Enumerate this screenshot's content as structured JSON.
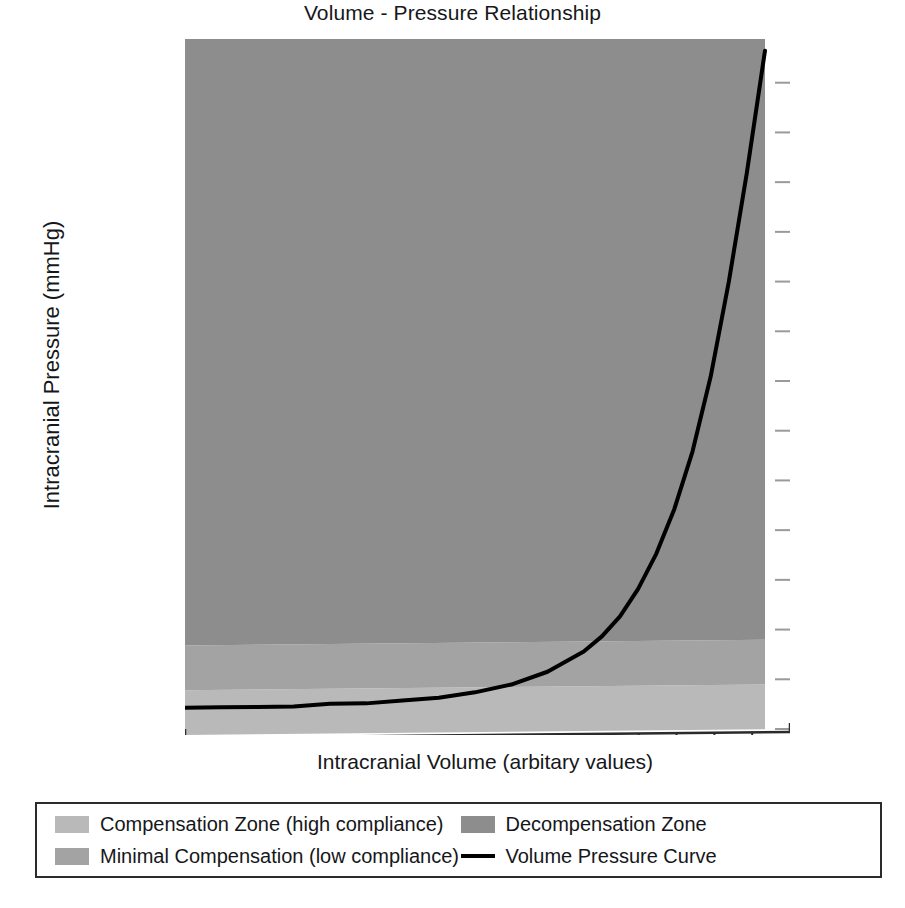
{
  "chart_data": {
    "type": "line",
    "title": "Volume - Pressure Relationship",
    "xlabel": "Intracranial Volume (arbitary values)",
    "ylabel": "Intracranial Pressure (mmHg)",
    "grid": false,
    "legend_position": "bottom",
    "xlim": [
      0,
      16
    ],
    "ylim": [
      0,
      280
    ],
    "yticks": [
      0,
      20,
      40,
      60,
      80,
      100,
      120,
      140,
      160,
      180,
      200,
      220,
      240,
      260,
      280
    ],
    "ytick_labels": [
      "0",
      "20",
      "40",
      "60",
      "80",
      "100",
      "120",
      "140",
      "160",
      "180",
      "200",
      "220",
      "240",
      "260",
      "280"
    ],
    "xticks": [
      0,
      1,
      2,
      3,
      4,
      5,
      6,
      7,
      8,
      9,
      10,
      11,
      12,
      13,
      14,
      15,
      16
    ],
    "xtick_labels": [
      "",
      "",
      "",
      "",
      "",
      "",
      "",
      "",
      "",
      "",
      "",
      "",
      "",
      "",
      "",
      "",
      ""
    ],
    "series": [
      {
        "name": "Volume Pressure Curve",
        "color": "#000000",
        "linewidth": 4,
        "x": [
          0.0,
          1.0,
          2.0,
          3.0,
          4.0,
          5.0,
          6.0,
          7.0,
          8.0,
          9.0,
          10.0,
          11.0,
          11.5,
          12.0,
          12.5,
          13.0,
          13.5,
          14.0,
          14.5,
          15.0,
          15.5,
          16.0
        ],
        "y": [
          11,
          11,
          11,
          11,
          12,
          12,
          13,
          14,
          16,
          19,
          24,
          32,
          38,
          46,
          57,
          71,
          89,
          112,
          142,
          180,
          224,
          273
        ]
      }
    ],
    "zones": [
      {
        "name": "Compensation Zone (high compliance)",
        "y_from": 0,
        "y_to": 18,
        "color": "#b9b9b9"
      },
      {
        "name": "Minimal Compensation (low compliance)",
        "y_from": 18,
        "y_to": 36,
        "color": "#a3a3a3"
      },
      {
        "name": "Decompensation Zone",
        "y_from": 36,
        "y_to": 280,
        "color": "#8d8d8d"
      }
    ],
    "legend_entries": [
      {
        "label": "Compensation Zone (high compliance)",
        "marker": "swatch",
        "color": "#b9b9b9"
      },
      {
        "label": "Minimal Compensation (low compliance)",
        "marker": "swatch",
        "color": "#a3a3a3"
      },
      {
        "label": "Decompensation Zone",
        "marker": "swatch",
        "color": "#8d8d8d"
      },
      {
        "label": "Volume Pressure Curve",
        "marker": "line",
        "color": "#000000"
      }
    ]
  }
}
